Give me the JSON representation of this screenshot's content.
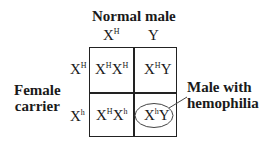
{
  "diagram": {
    "type": "punnett-square",
    "top_label": "Normal male",
    "left_label": [
      "Female",
      "carrier"
    ],
    "callout_label": [
      "Male with",
      "hemophilia"
    ],
    "column_headers": [
      {
        "base": "X",
        "sup": "H"
      },
      {
        "base": "Y",
        "sup": ""
      }
    ],
    "row_headers": [
      {
        "base": "X",
        "sup": "H"
      },
      {
        "base": "X",
        "sup": "h"
      }
    ],
    "cells": [
      [
        {
          "a": "X",
          "a_sup": "H",
          "b": "X",
          "b_sup": "H"
        },
        {
          "a": "X",
          "a_sup": "H",
          "b": "Y",
          "b_sup": ""
        }
      ],
      [
        {
          "a": "X",
          "a_sup": "H",
          "b": "X",
          "b_sup": "h"
        },
        {
          "a": "X",
          "a_sup": "h",
          "b": "Y",
          "b_sup": "",
          "highlighted": true
        }
      ]
    ],
    "colors": {
      "line": "#222222",
      "text": "#1a1a1a",
      "background": "#ffffff"
    }
  }
}
